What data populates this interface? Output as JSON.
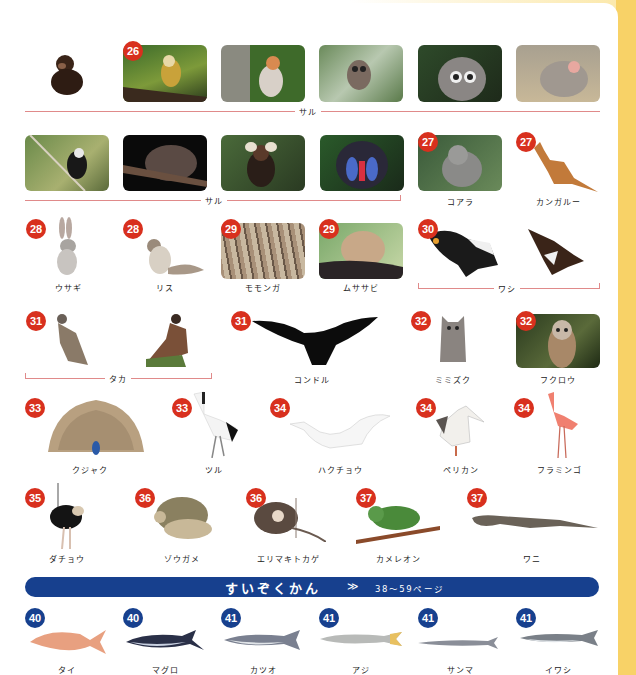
{
  "colors": {
    "badge_red": "#d8301e",
    "badge_blue": "#17408e",
    "banner": "#17408e",
    "group_line": "#e08a8a",
    "side_strip": "#f8d267"
  },
  "row1": {
    "items": [
      {
        "name": "chimpanzee",
        "badge": ""
      },
      {
        "name": "squirrel-monkey",
        "badge": "26"
      },
      {
        "name": "proboscis-monkey",
        "badge": ""
      },
      {
        "name": "tarsier",
        "badge": ""
      },
      {
        "name": "ring-tailed-lemur",
        "badge": ""
      },
      {
        "name": "baboon",
        "badge": ""
      }
    ],
    "group_label": "サル"
  },
  "row2": {
    "items": [
      {
        "name": "gibbon",
        "badge": ""
      },
      {
        "name": "slow-loris",
        "badge": ""
      },
      {
        "name": "marmoset",
        "badge": ""
      },
      {
        "name": "mandrill",
        "badge": ""
      },
      {
        "name": "koala",
        "badge": "27",
        "label": "コアラ"
      },
      {
        "name": "kangaroo",
        "badge": "27",
        "label": "カンガルー"
      }
    ],
    "group_label": "サル"
  },
  "row3": {
    "items": [
      {
        "name": "rabbit",
        "badge": "28",
        "label": "ウサギ"
      },
      {
        "name": "squirrel",
        "badge": "28",
        "label": "リス"
      },
      {
        "name": "momonga",
        "badge": "29",
        "label": "モモンガ"
      },
      {
        "name": "musasabi",
        "badge": "29",
        "label": "ムササビ"
      },
      {
        "name": "eagle-1",
        "badge": "30"
      },
      {
        "name": "eagle-2",
        "badge": ""
      }
    ],
    "group_label": "ワシ"
  },
  "row4": {
    "items": [
      {
        "name": "hawk-1",
        "badge": "31"
      },
      {
        "name": "hawk-2",
        "badge": ""
      },
      {
        "name": "condor",
        "badge": "31",
        "label": "コンドル"
      },
      {
        "name": "horned-owl",
        "badge": "32",
        "label": "ミミズク"
      },
      {
        "name": "owl",
        "badge": "32",
        "label": "フクロウ"
      }
    ],
    "group_label": "タカ"
  },
  "row5": {
    "items": [
      {
        "name": "peacock",
        "badge": "33",
        "label": "クジャク"
      },
      {
        "name": "crane",
        "badge": "33",
        "label": "ツル"
      },
      {
        "name": "swan",
        "badge": "34",
        "label": "ハクチョウ"
      },
      {
        "name": "pelican",
        "badge": "34",
        "label": "ペリカン"
      },
      {
        "name": "flamingo",
        "badge": "34",
        "label": "フラミンゴ"
      }
    ]
  },
  "row6": {
    "items": [
      {
        "name": "ostrich",
        "badge": "35",
        "label": "ダチョウ"
      },
      {
        "name": "tortoise",
        "badge": "36",
        "label": "ゾウガメ"
      },
      {
        "name": "frilled-lizard",
        "badge": "36",
        "label": "エリマキトカゲ"
      },
      {
        "name": "chameleon",
        "badge": "37",
        "label": "カメレオン"
      },
      {
        "name": "crocodile",
        "badge": "37",
        "label": "ワニ"
      }
    ]
  },
  "banner": {
    "title": "すいぞくかん",
    "arrow": "≫",
    "pages": "38〜59ページ"
  },
  "row7": {
    "items": [
      {
        "name": "sea-bream",
        "badge": "40",
        "label": "タイ"
      },
      {
        "name": "tuna",
        "badge": "40",
        "label": "マグロ"
      },
      {
        "name": "bonito",
        "badge": "41",
        "label": "カツオ"
      },
      {
        "name": "horse-mackerel",
        "badge": "41",
        "label": "アジ"
      },
      {
        "name": "saury",
        "badge": "41",
        "label": "サンマ"
      },
      {
        "name": "sardine",
        "badge": "41",
        "label": "イワシ"
      }
    ]
  }
}
